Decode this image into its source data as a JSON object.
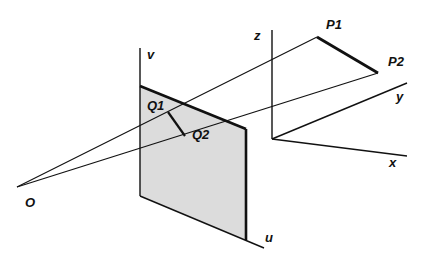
{
  "diagram": {
    "labels": {
      "origin": "O",
      "image_axis_v": "v",
      "image_axis_u": "u",
      "world_axis_x": "x",
      "world_axis_y": "y",
      "world_axis_z": "z",
      "point_p1": "P1",
      "point_p2": "P2",
      "point_q1": "Q1",
      "point_q2": "Q2"
    },
    "colors": {
      "line": "#111111",
      "plane_fill": "#dcdcdc"
    }
  }
}
